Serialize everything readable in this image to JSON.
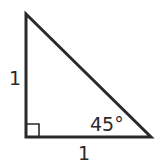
{
  "diagram": {
    "type": "right-triangle",
    "colors": {
      "stroke": "#2a2a2a",
      "background": "#ffffff"
    },
    "vertices": {
      "top": [
        26,
        14
      ],
      "right_angle": [
        26,
        137
      ],
      "bottom_right": [
        151,
        137
      ]
    },
    "labels": {
      "left_leg": "1",
      "bottom_leg": "1",
      "angle": "45°"
    },
    "right_angle_marker": {
      "size": 13
    }
  }
}
